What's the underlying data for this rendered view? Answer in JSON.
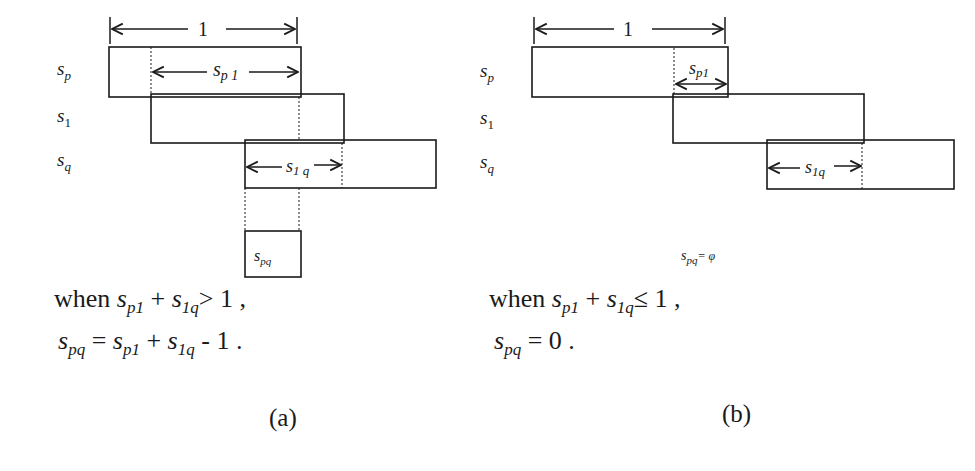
{
  "panel_a": {
    "caption": "(a)",
    "unit_label": "1",
    "row_labels": {
      "sp": "s",
      "sp_sub": "p",
      "s1": "s",
      "s1_sub": "1",
      "sq": "s",
      "sq_sub": "q"
    },
    "spans": {
      "sp1": "s",
      "sp1_sub": "p 1",
      "s1q": "s",
      "s1q_sub": "1 q"
    },
    "result_box": {
      "label": "s",
      "sub": "pq"
    },
    "condition": {
      "prefix": "when ",
      "a": "s",
      "a_sub": "p1",
      "plus": " + ",
      "b": "s",
      "b_sub": "1q",
      "rel": "> 1 ,"
    },
    "result": {
      "lhs": "s",
      "lhs_sub": "pq",
      "eq": " = ",
      "a": "s",
      "a_sub": "p1",
      "plus": " + ",
      "b": "s",
      "b_sub": "1q",
      "tail": " - 1 ."
    }
  },
  "panel_b": {
    "caption": "(b)",
    "unit_label": "1",
    "row_labels": {
      "sp": "s",
      "sp_sub": "p",
      "s1": "s",
      "s1_sub": "1",
      "sq": "s",
      "sq_sub": "q"
    },
    "spans": {
      "sp1": "s",
      "sp1_sub": "p1",
      "s1q": "s",
      "s1q_sub": "1q"
    },
    "empty_note": {
      "label": "s",
      "sub": "pq",
      "tail": "= φ"
    },
    "condition": {
      "prefix": "when ",
      "a": "s",
      "a_sub": "p1",
      "plus": " + ",
      "b": "s",
      "b_sub": "1q",
      "rel": "≤ 1 ,"
    },
    "result": {
      "lhs": "s",
      "lhs_sub": "pq",
      "eq": " = ",
      "tail": "0 ."
    }
  }
}
